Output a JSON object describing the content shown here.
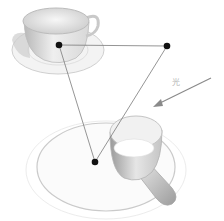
{
  "diagram": {
    "light_label": "光",
    "objects": [
      {
        "name": "teacup-on-saucer"
      },
      {
        "name": "milk-pan-on-plate"
      }
    ],
    "points": [
      {
        "id": "cup-point"
      },
      {
        "id": "top-right-point"
      },
      {
        "id": "plate-point"
      }
    ],
    "colors": {
      "point": "#111111",
      "line": "#7a7a7a",
      "arrow": "#8a8a8a",
      "sketch": "#c8c8c8"
    }
  }
}
